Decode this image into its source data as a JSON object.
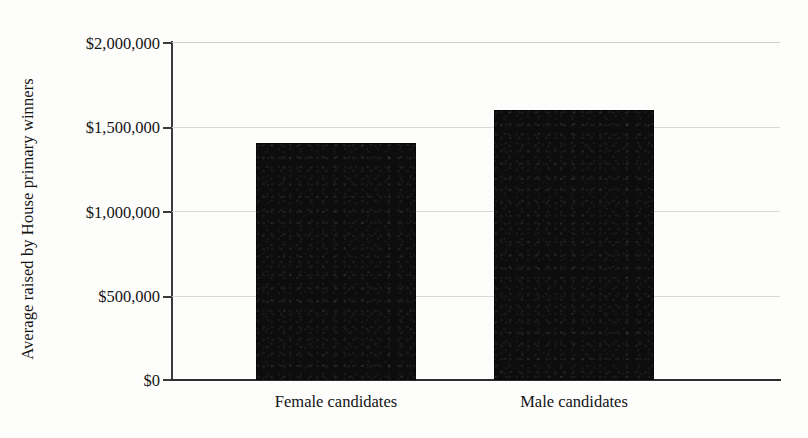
{
  "chart_data": {
    "type": "bar",
    "title": "",
    "xlabel": "",
    "ylabel": "Average raised by House primary winners",
    "categories": [
      "Female candidates",
      "Male candidates"
    ],
    "values": [
      1400000,
      1600000
    ],
    "ylim": [
      0,
      2000000
    ],
    "ytick_labels": [
      "$2,000,000",
      "$1,500,000",
      "$1,000,000",
      "$500,000",
      "$0"
    ],
    "ytick_values": [
      2000000,
      1500000,
      1000000,
      500000,
      0
    ],
    "grid": true,
    "legend": "none",
    "bar_color": "#0d0d0d",
    "gridline_color": "#d8d8d6",
    "axis_color": "#2e2e2e",
    "background_color": "#fdfdfc"
  },
  "axes": {
    "y_title": "Average raised by House primary winners"
  }
}
